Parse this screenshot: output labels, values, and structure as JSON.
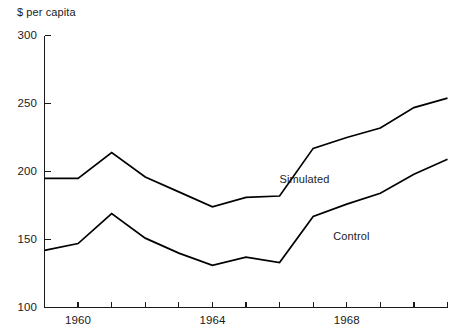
{
  "chart_data": {
    "type": "line",
    "title": "",
    "ylabel": "$ per capita",
    "xlabel": "",
    "ylim": [
      100,
      300
    ],
    "yticks": [
      100,
      150,
      200,
      250,
      300
    ],
    "ytick_labels": [
      "100",
      "150",
      "200",
      "250",
      "300"
    ],
    "xlim": [
      1959,
      1971
    ],
    "x": [
      1959,
      1960,
      1961,
      1962,
      1963,
      1964,
      1965,
      1966,
      1967,
      1968,
      1969,
      1970,
      1971
    ],
    "xticks": [
      1959,
      1960,
      1961,
      1962,
      1963,
      1964,
      1965,
      1966,
      1967,
      1968,
      1969,
      1970,
      1971
    ],
    "xtick_labels": [
      "",
      "1960",
      "",
      "",
      "",
      "1964",
      "",
      "",
      "",
      "1968",
      "",
      "",
      ""
    ],
    "grid": false,
    "legend_position": "inline-annotation",
    "series": [
      {
        "name": "Simulated",
        "values": [
          195,
          195,
          214,
          196,
          185,
          174,
          181,
          182,
          217,
          225,
          232,
          247,
          254
        ],
        "color": "#000000"
      },
      {
        "name": "Control",
        "values": [
          142,
          147,
          169,
          151,
          140,
          131,
          137,
          133,
          167,
          176,
          184,
          198,
          209
        ],
        "color": "#000000"
      }
    ],
    "annotations": [
      {
        "text": "Simulated",
        "x": 1966.0,
        "y": 194
      },
      {
        "text": "Control",
        "x": 1967.6,
        "y": 152
      }
    ]
  },
  "axis": {
    "line_color": "#1a1a1a",
    "tick_length": 6
  }
}
